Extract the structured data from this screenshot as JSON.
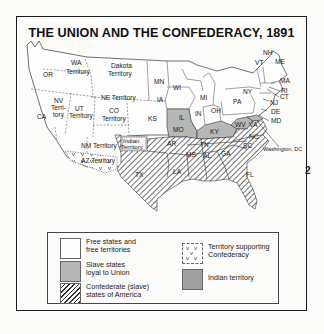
{
  "title": "THE UNION AND THE CONFEDERACY, 1891",
  "colors": {
    "free": "#fdfdfd",
    "slave_union": "#b7b7b7",
    "confederate_hatch": "#333333",
    "border": "#1a1a1a"
  },
  "map": {
    "labels": {
      "wa": "WA",
      "wa_sub": "Territory",
      "or": "OR",
      "dakota": "Dakota",
      "dakota_sub": "Territory",
      "mn": "MN",
      "wi": "WI",
      "mi": "MI",
      "ny": "NY",
      "vt": "VT",
      "nh": "NH",
      "me": "ME",
      "ma": "MA",
      "ri": "RI",
      "ct": "CT",
      "nj": "NJ",
      "de": "DE",
      "md": "MD",
      "pa": "PA",
      "oh": "OH",
      "in": "IN",
      "il": "IL",
      "ia": "IA",
      "ne": "NE Territory",
      "nv1": "NV",
      "nv2": "Terri-",
      "nv3": "tory",
      "ca": "CA",
      "ut": "UT",
      "ut_sub": "Territory",
      "co": "CO",
      "co_sub": "Territory",
      "ks": "KS",
      "mo": "MO",
      "ky": "KY",
      "wv": "WV",
      "va": "VA",
      "nc": "NC",
      "sc": "SC",
      "tn": "TN",
      "ga": "GA",
      "al": "AL",
      "ms": "MS",
      "la": "LA",
      "ar": "AR",
      "tx": "TX",
      "fl": "FL",
      "indian": "Indian",
      "indian_sub": "Territory",
      "nm": "NM Territory",
      "az": "AZ Territory",
      "washington_dc": "Washington, DC"
    }
  },
  "legend": {
    "items": [
      {
        "key": "free",
        "label_line1": "Free states and",
        "label_line2": "free territories"
      },
      {
        "key": "slave_union",
        "label_line1": "Slave states",
        "label_line2": "loyal to Union"
      },
      {
        "key": "confederate",
        "label_line1": "Confederate (slave)",
        "label_line2": "states of America"
      },
      {
        "key": "territory_confederacy",
        "label_line1": "Territory supporting",
        "label_line2": "Confederacy"
      },
      {
        "key": "indian_territory",
        "label_line1": "Indian territory",
        "label_line2": ""
      }
    ]
  },
  "stray_mark": "2"
}
